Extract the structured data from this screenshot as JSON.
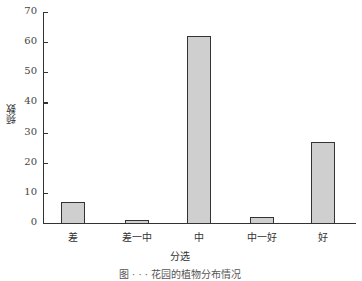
{
  "chart_data": {
    "type": "bar",
    "title": "",
    "xlabel": "分选",
    "ylabel": "频数",
    "categories": [
      "差",
      "差一中",
      "中",
      "中一好",
      "好"
    ],
    "values": [
      7,
      1,
      62,
      2,
      27
    ],
    "ylim": [
      0,
      70
    ],
    "yticks": [
      0,
      10,
      20,
      30,
      40,
      50,
      60,
      70
    ],
    "grid": false,
    "legend": null,
    "bar_color": "#cfcfcf",
    "edge_color": "#333333"
  },
  "caption": "图 · · · 花园的植物分布情况"
}
